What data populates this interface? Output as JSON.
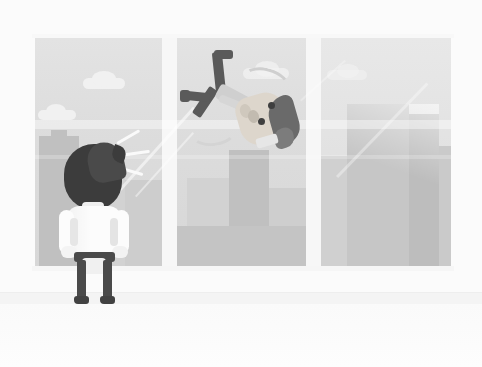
{
  "scene": {
    "title": "Businessman at office window watching person fall past",
    "style": "flat vector illustration",
    "canvas": {
      "width": 482,
      "height": 367
    },
    "palette": {
      "background": "#ffffff",
      "wall": "#fbfbfb",
      "floor": "#f4f4f4",
      "window_frame": "#f7f7f7",
      "sky": "#dcdcdc",
      "cloud": "#f1f1f1",
      "building_mid": "#c9c9c9",
      "building_dark": "#c0c0c0",
      "building_light": "#d2d2d2",
      "hair_dark": "#3a3a3a",
      "shirt_white": "#fcfcfc",
      "trousers_dark": "#4a4a4a",
      "skin": "#ddd6cc",
      "glass_highlight": "#ffffff"
    }
  },
  "room": {
    "wall_label": "office interior wall",
    "floor_label": "office floor"
  },
  "window": {
    "label": "floor-to-ceiling office window",
    "panel_count": 3,
    "panels": [
      {
        "name": "left-panel",
        "contents": "clouds and city skyline"
      },
      {
        "name": "middle-panel",
        "contents": "falling person and skyline"
      },
      {
        "name": "right-panel",
        "contents": "tall building and reflections"
      }
    ],
    "mullions": [
      {
        "name": "mullion-left"
      },
      {
        "name": "mullion-right"
      }
    ],
    "reflections": [
      {
        "name": "horizontal-reflection-band"
      },
      {
        "name": "diagonal-glass-glint"
      }
    ]
  },
  "clouds": [
    {
      "name": "cloud-upper-left",
      "pane": "left"
    },
    {
      "name": "cloud-lower-left",
      "pane": "left"
    },
    {
      "name": "cloud-middle",
      "pane": "middle"
    },
    {
      "name": "cloud-right",
      "pane": "right"
    }
  ],
  "skyline": {
    "label": "city skyline seen through glass",
    "buildings": [
      {
        "name": "building-left-tall",
        "pane": "left"
      },
      {
        "name": "building-left-short",
        "pane": "left"
      },
      {
        "name": "building-mid-tall",
        "pane": "middle"
      },
      {
        "name": "building-mid-short",
        "pane": "middle"
      },
      {
        "name": "building-right-block",
        "pane": "right"
      },
      {
        "name": "building-right-slab",
        "pane": "right"
      }
    ]
  },
  "characters": {
    "observer": {
      "name": "businessman-from-behind",
      "pose": "standing, hands on hips, facing window",
      "parts": [
        "hair",
        "shirt",
        "left-arm",
        "right-arm",
        "belt",
        "left-leg",
        "right-leg",
        "left-shoe",
        "right-shoe"
      ]
    },
    "faller": {
      "name": "falling-person",
      "pose": "upside down, falling past the window",
      "parts": [
        "head",
        "hair",
        "eye-left",
        "eye-right",
        "open-mouth",
        "ear",
        "arm",
        "left-leg",
        "right-leg",
        "left-shoe",
        "right-shoe",
        "motion-arc"
      ]
    }
  },
  "effects": [
    {
      "name": "shock-lines",
      "description": "surprise lines beside observer's head"
    },
    {
      "name": "motion-arc",
      "description": "curved motion trail behind falling person"
    }
  ]
}
